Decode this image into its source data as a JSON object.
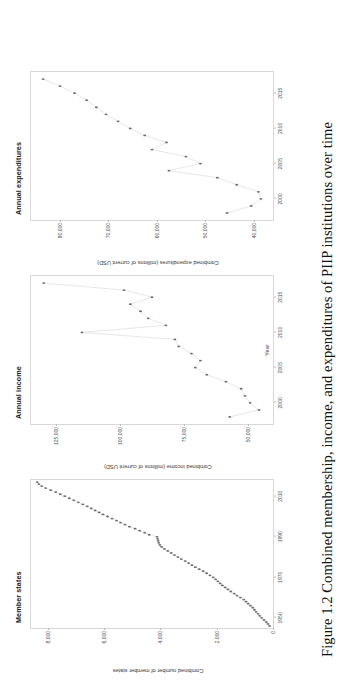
{
  "figure": {
    "caption": "Figure 1.2  Combined membership, income, and expenditures of PIIP institutions over time",
    "rotation_deg": -90,
    "background": "#ffffff",
    "marker_color": "#6d6d6d",
    "line_color": "#c9c9c9"
  },
  "panels": [
    {
      "id": "member-states",
      "title": "Member states",
      "ylabel": "Combined number of member states",
      "xlabel": "",
      "yticks": [
        "8000",
        "6000",
        "4000",
        "2000",
        "0"
      ],
      "xticks": [
        "1950",
        "1970",
        "1990",
        "2010"
      ]
    },
    {
      "id": "annual-income",
      "title": "Annual income",
      "ylabel": "Combined income (millions of current USD)",
      "xlabel": "Year",
      "yticks": [
        "125,000",
        "100,000",
        "75,000",
        "50,000"
      ],
      "xticks": [
        "2000",
        "2005",
        "2010",
        "2015"
      ]
    },
    {
      "id": "annual-expenditures",
      "title": "Annual expenditures",
      "ylabel": "Combined expenditures (millions of current USD)",
      "xlabel": "",
      "yticks": [
        "80,000",
        "70,000",
        "60,000",
        "50,000",
        "40,000"
      ],
      "xticks": [
        "2000",
        "2005",
        "2010",
        "2015"
      ]
    }
  ],
  "chart_data": [
    {
      "type": "line",
      "id": "member-states",
      "title": "Member states",
      "xlabel": "",
      "ylabel": "Combined number of member states",
      "xlim": [
        1945,
        2018
      ],
      "ylim": [
        0,
        8600
      ],
      "xticks": [
        1950,
        1970,
        1990,
        2010
      ],
      "yticks": [
        0,
        2000,
        4000,
        6000,
        8000
      ],
      "grid": false,
      "legend": "none",
      "x": [
        1946,
        1947,
        1948,
        1949,
        1950,
        1951,
        1952,
        1953,
        1954,
        1955,
        1956,
        1957,
        1958,
        1959,
        1960,
        1961,
        1962,
        1963,
        1964,
        1965,
        1966,
        1967,
        1968,
        1969,
        1970,
        1971,
        1972,
        1973,
        1974,
        1975,
        1976,
        1977,
        1978,
        1979,
        1980,
        1981,
        1982,
        1983,
        1984,
        1985,
        1986,
        1987,
        1988,
        1989,
        1990,
        1991,
        1992,
        1993,
        1994,
        1995,
        1996,
        1997,
        1998,
        1999,
        2000,
        2001,
        2002,
        2003,
        2004,
        2005,
        2006,
        2007,
        2008,
        2009,
        2010,
        2011,
        2012,
        2013,
        2014,
        2015,
        2016,
        2017
      ],
      "y": [
        120,
        180,
        240,
        320,
        400,
        470,
        530,
        600,
        660,
        720,
        800,
        880,
        960,
        1040,
        1160,
        1280,
        1380,
        1500,
        1600,
        1700,
        1800,
        1880,
        1960,
        2040,
        2120,
        2240,
        2360,
        2480,
        2620,
        2760,
        2880,
        3000,
        3120,
        3260,
        3380,
        3500,
        3620,
        3740,
        3860,
        3960,
        4020,
        4060,
        4080,
        4100,
        4120,
        4400,
        4560,
        4740,
        4900,
        5100,
        5260,
        5420,
        5560,
        5720,
        5880,
        6040,
        6180,
        6320,
        6460,
        6600,
        6760,
        6920,
        7080,
        7240,
        7400,
        7560,
        7720,
        7900,
        8080,
        8220,
        8320,
        8380
      ]
    },
    {
      "type": "line",
      "id": "annual-income",
      "title": "Annual income",
      "xlabel": "Year",
      "ylabel": "Combined income (millions of current USD)",
      "xlim": [
        1997,
        2018
      ],
      "ylim": [
        40000,
        135000
      ],
      "xticks": [
        2000,
        2005,
        2010,
        2015
      ],
      "yticks": [
        50000,
        75000,
        100000,
        125000
      ],
      "grid": false,
      "legend": "none",
      "x": [
        1998,
        1999,
        2000,
        2001,
        2002,
        2003,
        2004,
        2005,
        2006,
        2007,
        2008,
        2009,
        2010,
        2011,
        2012,
        2013,
        2014,
        2015,
        2016,
        2017
      ],
      "y": [
        57000,
        45500,
        49000,
        51000,
        52500,
        58500,
        66000,
        70500,
        68500,
        72000,
        77000,
        78500,
        115000,
        82000,
        89000,
        92000,
        96000,
        87500,
        98500,
        130000
      ]
    },
    {
      "type": "line",
      "id": "annual-expenditures",
      "title": "Annual expenditures",
      "xlabel": "",
      "ylabel": "Combined expenditures (millions of current USD)",
      "xlim": [
        1997,
        2018
      ],
      "ylim": [
        36000,
        86000
      ],
      "xticks": [
        2000,
        2005,
        2010,
        2015
      ],
      "yticks": [
        40000,
        50000,
        60000,
        70000,
        80000
      ],
      "grid": false,
      "legend": "none",
      "x": [
        1998,
        1999,
        2000,
        2001,
        2002,
        2003,
        2004,
        2005,
        2006,
        2007,
        2008,
        2009,
        2010,
        2011,
        2012,
        2013,
        2014,
        2015,
        2016,
        2017
      ],
      "y": [
        45500,
        40500,
        38500,
        39000,
        43500,
        47500,
        57500,
        51000,
        54000,
        61000,
        58000,
        62500,
        65500,
        68000,
        70500,
        72500,
        74500,
        77000,
        80000,
        83500
      ]
    }
  ]
}
